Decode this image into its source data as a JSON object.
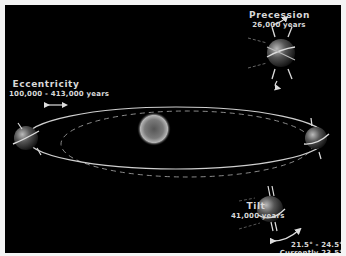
{
  "diagram": {
    "background_color": "#000000",
    "border_color": "#f4f4f4",
    "line_color": "#d8d8d8",
    "eccentricity": {
      "label": "Eccentricity",
      "period": "100,000 - 413,000 years",
      "icon": "double-arrow-horizontal"
    },
    "precession": {
      "label": "Precession",
      "period": "26,000 years",
      "icon": "curved-rotation-arrows"
    },
    "tilt": {
      "label": "Tilt",
      "period": "41,000 years",
      "range": "21.5° - 24.5°",
      "current": "Currently 23.5°",
      "icon": "curved-double-arrow"
    },
    "elements": {
      "sun": "sun",
      "orbits": [
        "solid-orbit",
        "dashed-orbit"
      ],
      "planets": [
        "earth-left",
        "earth-right",
        "earth-precession",
        "earth-tilt"
      ]
    }
  }
}
